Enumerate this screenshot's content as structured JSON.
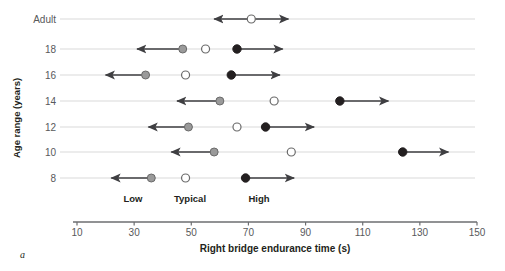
{
  "panel": {
    "label": "a"
  },
  "axes": {
    "ylabel": "Age range (years)",
    "xlabel": "Right bridge endurance time (s)",
    "xticks": [
      10,
      30,
      50,
      70,
      90,
      110,
      130,
      150
    ],
    "xlim": [
      10,
      150
    ],
    "ycategories": [
      "Adult",
      "18",
      "16",
      "14",
      "12",
      "10",
      "8"
    ],
    "grid": true
  },
  "legend": {
    "position": "inside-bottom",
    "entries": [
      {
        "key": "low",
        "label": "Low",
        "marker": "filled-gray-circle",
        "color": "#9a9a9a"
      },
      {
        "key": "typical",
        "label": "Typical",
        "marker": "open-circle",
        "color": "#ffffff"
      },
      {
        "key": "high",
        "label": "High",
        "marker": "filled-black-circle",
        "color": "#231f20"
      }
    ]
  },
  "chart_data": {
    "type": "scatter",
    "title": "",
    "xlabel": "Right bridge endurance time (s)",
    "ylabel": "Age range (years)",
    "xlim": [
      10,
      150
    ],
    "xticks": [
      10,
      30,
      50,
      70,
      90,
      110,
      130,
      150
    ],
    "categories": [
      "Adult",
      "18",
      "16",
      "14",
      "12",
      "10",
      "8"
    ],
    "series": [
      {
        "name": "Low",
        "marker": "filled-gray-circle",
        "values": [
          null,
          47,
          34,
          60,
          49,
          58,
          36
        ]
      },
      {
        "name": "Typical",
        "marker": "open-circle",
        "values": [
          71,
          55,
          48,
          79,
          66,
          85,
          48
        ]
      },
      {
        "name": "High",
        "marker": "filled-black-circle",
        "values": [
          null,
          66,
          64,
          102,
          76,
          124,
          69
        ]
      }
    ],
    "annotations": [
      {
        "category": "Adult",
        "series": "Typical",
        "arrow": "both",
        "from": 58,
        "to": 84
      },
      {
        "category": "18",
        "series": "Low",
        "arrow": "left",
        "from": 47,
        "to": 31
      },
      {
        "category": "18",
        "series": "High",
        "arrow": "right",
        "from": 66,
        "to": 82
      },
      {
        "category": "16",
        "series": "Low",
        "arrow": "left",
        "from": 34,
        "to": 20
      },
      {
        "category": "16",
        "series": "High",
        "arrow": "right",
        "from": 64,
        "to": 81
      },
      {
        "category": "14",
        "series": "Low",
        "arrow": "left",
        "from": 60,
        "to": 45
      },
      {
        "category": "14",
        "series": "High",
        "arrow": "right",
        "from": 102,
        "to": 119
      },
      {
        "category": "12",
        "series": "Low",
        "arrow": "left",
        "from": 49,
        "to": 35
      },
      {
        "category": "12",
        "series": "High",
        "arrow": "right",
        "from": 76,
        "to": 93
      },
      {
        "category": "10",
        "series": "Low",
        "arrow": "left",
        "from": 58,
        "to": 43
      },
      {
        "category": "10",
        "series": "High",
        "arrow": "right",
        "from": 124,
        "to": 140
      },
      {
        "category": "8",
        "series": "Low",
        "arrow": "left",
        "from": 36,
        "to": 22
      },
      {
        "category": "8",
        "series": "High",
        "arrow": "right",
        "from": 69,
        "to": 86
      }
    ]
  }
}
